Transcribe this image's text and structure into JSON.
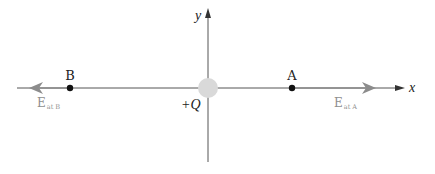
{
  "diagram": {
    "axes": {
      "x_label": "x",
      "y_label": "y"
    },
    "charge": {
      "label": "+Q",
      "color": "#d9d9d9"
    },
    "points": [
      {
        "id": "A",
        "label": "A",
        "field_label": "E",
        "field_subscript": "at A",
        "field_direction": "right"
      },
      {
        "id": "B",
        "label": "B",
        "field_label": "E",
        "field_subscript": "at B",
        "field_direction": "left"
      }
    ],
    "colors": {
      "axis": "#555555",
      "field_vector": "#8c8c8c",
      "field_label": "#8f8f8f",
      "point": "#111111",
      "text": "#222222"
    }
  }
}
